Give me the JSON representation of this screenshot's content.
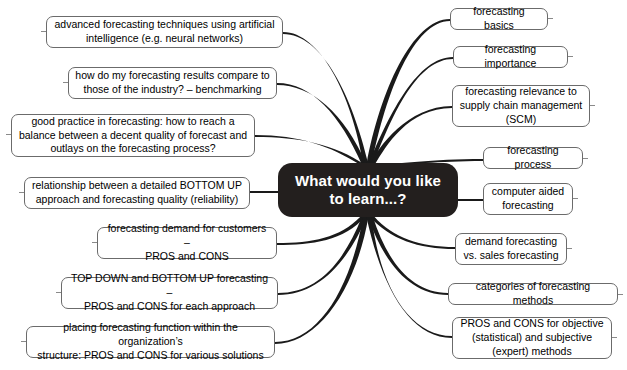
{
  "diagram": {
    "type": "mind-map",
    "title": "What would you like to learn...?",
    "center": {
      "label": "What would you like to learn...?",
      "line1": "What would you like",
      "line2": "to learn...?",
      "background": "#231f1e",
      "text_color": "#ffffff"
    },
    "style": {
      "node_border": "#6b6b6b",
      "node_background": "#ffffff",
      "connector_color": "#1a1a1a",
      "page_background": "#ffffff"
    },
    "left_branches": [
      {
        "id": "advanced-techniques",
        "lines": [
          "advanced forecasting techniques using artificial",
          "intelligence (e.g. neural networks)"
        ]
      },
      {
        "id": "benchmarking",
        "lines": [
          "how do my forecasting results compare to",
          "those of the industry? – benchmarking"
        ]
      },
      {
        "id": "good-practice",
        "lines": [
          "good practice in forecasting: how to reach a",
          "balance between a decent quality of forecast and",
          "outlays on the forecasting process?"
        ]
      },
      {
        "id": "bottom-up-quality",
        "lines": [
          "relationship between a detailed BOTTOM UP",
          "approach and forecasting quality (reliability)"
        ]
      },
      {
        "id": "demand-for-customers",
        "lines": [
          "forecasting demand for customers –",
          "PROS and CONS"
        ]
      },
      {
        "id": "top-down-bottom-up",
        "lines": [
          "TOP DOWN and BOTTOM UP forecasting –",
          "PROS and CONS for each approach"
        ]
      },
      {
        "id": "placing-function",
        "lines": [
          "placing forecasting function within the organization’s",
          "structure: PROS and CONS for various solutions"
        ]
      }
    ],
    "right_branches": [
      {
        "id": "basics",
        "lines": [
          "forecasting basics"
        ]
      },
      {
        "id": "importance",
        "lines": [
          "forecasting importance"
        ]
      },
      {
        "id": "scm-relevance",
        "lines": [
          "forecasting relevance to",
          "supply chain management",
          "(SCM)"
        ]
      },
      {
        "id": "process",
        "lines": [
          "forecasting process"
        ]
      },
      {
        "id": "computer-aided",
        "lines": [
          "computer aided",
          "forecasting"
        ]
      },
      {
        "id": "demand-vs-sales",
        "lines": [
          "demand forecasting",
          "vs. sales forecasting"
        ]
      },
      {
        "id": "categories",
        "lines": [
          "categories of forecasting methods"
        ]
      },
      {
        "id": "objective-subjective",
        "lines": [
          "PROS and CONS for objective",
          "(statistical) and subjective",
          "(expert) methods"
        ]
      }
    ]
  }
}
